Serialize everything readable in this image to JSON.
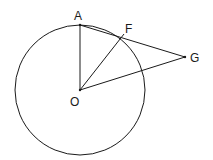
{
  "diagram": {
    "type": "geometry",
    "colors": {
      "stroke": "#1a1a1a",
      "background": "#ffffff"
    },
    "circle": {
      "center": "O",
      "cx": 80,
      "cy": 90,
      "r": 65
    },
    "points": [
      {
        "id": "A",
        "label": "A",
        "x": 80,
        "y": 25,
        "label_x": 75,
        "label_y": 20
      },
      {
        "id": "F",
        "label": "F",
        "x": 122,
        "y": 38,
        "label_x": 125,
        "label_y": 33
      },
      {
        "id": "G",
        "label": "G",
        "x": 185,
        "y": 57,
        "label_x": 190,
        "label_y": 62
      },
      {
        "id": "O",
        "label": "O",
        "x": 80,
        "y": 90,
        "label_x": 71,
        "label_y": 105
      }
    ],
    "segments": [
      {
        "from": "O",
        "to": "A"
      },
      {
        "from": "O",
        "to": "F"
      },
      {
        "from": "O",
        "to": "G"
      },
      {
        "from": "A",
        "to": "G"
      }
    ]
  }
}
